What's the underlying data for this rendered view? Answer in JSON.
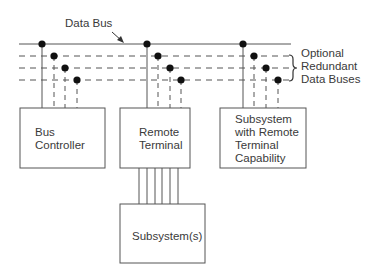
{
  "diagram": {
    "title_label": "Data Bus",
    "redundant_label": [
      "Optional",
      "Redundant",
      "Data Buses"
    ],
    "nodes": {
      "bus_controller": [
        "Bus",
        "Controller"
      ],
      "remote_terminal": [
        "Remote",
        "Terminal"
      ],
      "subsystem_rt": [
        "Subsystem",
        "with Remote",
        "Terminal",
        "Capability"
      ],
      "subsystems": [
        "Subsystem(s)"
      ]
    },
    "buses": [
      {
        "name": "primary-data-bus",
        "style": "solid"
      },
      {
        "name": "redundant-bus-1",
        "style": "dashed"
      },
      {
        "name": "redundant-bus-2",
        "style": "dashed"
      },
      {
        "name": "redundant-bus-3",
        "style": "dashed"
      }
    ],
    "connections": {
      "remote_terminal_to_subsystems_lines": 6
    },
    "colors": {
      "line": "#555555",
      "dot": "#111111",
      "text": "#3a3a3a"
    }
  }
}
